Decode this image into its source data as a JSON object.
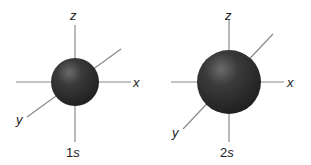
{
  "diagram": {
    "orbitals": [
      {
        "name": "1s",
        "number": "1",
        "letter": "s",
        "axes": {
          "z": "z",
          "x": "x",
          "y": "y"
        }
      },
      {
        "name": "2s",
        "number": "2",
        "letter": "s",
        "axes": {
          "z": "z",
          "x": "x",
          "y": "y"
        }
      }
    ],
    "colors": {
      "sphere": "#2b2b2b",
      "highlight": "#6e6e6e",
      "axis": "#8a8a8a"
    }
  }
}
